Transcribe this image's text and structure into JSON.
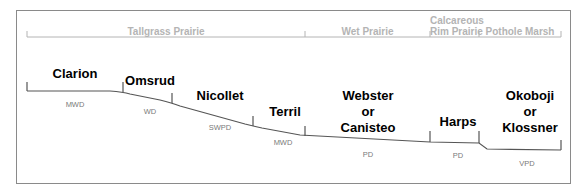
{
  "vegetation_zones": [
    {
      "label": "Tallgrass Prairie",
      "x_start": 27,
      "x_end": 305
    },
    {
      "label": "Wet Prairie",
      "x_start": 305,
      "x_end": 430
    },
    {
      "label_line1": "Calcareous",
      "label_line2": "Rim Prairie",
      "x_start": 430,
      "x_end": 479
    },
    {
      "label": "Pothole Marsh",
      "x_start": 479,
      "x_end": 561
    }
  ],
  "soils": [
    {
      "name": "Clarion",
      "drainage": "MWD"
    },
    {
      "name": "Omsrud",
      "drainage": "WD"
    },
    {
      "name": "Nicollet",
      "drainage": "SWPD"
    },
    {
      "name": "Terril",
      "drainage": "MWD"
    },
    {
      "name_line1": "Webster",
      "name_line2": "or",
      "name_line3": "Canisteo",
      "drainage": "PD"
    },
    {
      "name": "Harps",
      "drainage": "PD"
    },
    {
      "name_line1": "Okoboji",
      "name_line2": "or",
      "name_line3": "Klossner",
      "drainage": "VPD"
    }
  ],
  "colors": {
    "frame": "#8a8a8a",
    "zone_text": "#b4b4b4",
    "profile_line": "#555555",
    "soil_text": "#000000",
    "drainage_text": "#7a7a7a"
  }
}
